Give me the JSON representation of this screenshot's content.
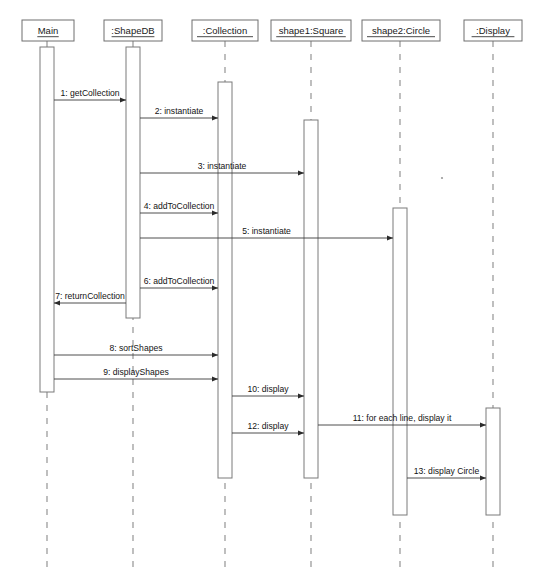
{
  "diagram": {
    "type": "uml-sequence-diagram",
    "canvas": {
      "width": 544,
      "height": 582
    },
    "colors": {
      "background": "#ffffff",
      "box_stroke": "#6e6e6e",
      "lifeline_stroke": "#8a8a8a",
      "activation_stroke": "#7a7a7a",
      "message_stroke": "#3b3b3b",
      "text": "#141414"
    },
    "participants": [
      {
        "id": "main",
        "label": "Main",
        "center_x": 47,
        "box": {
          "x": 22,
          "y": 20,
          "width": 52,
          "height": 21
        },
        "lifeline_top": 41,
        "lifeline_bottom": 570,
        "activations": [
          {
            "top": 47,
            "bottom": 392
          }
        ]
      },
      {
        "id": "shapedb",
        "label": ":ShapeDB",
        "center_x": 133,
        "box": {
          "x": 104,
          "y": 20,
          "width": 58,
          "height": 21
        },
        "lifeline_top": 41,
        "lifeline_bottom": 570,
        "activations": [
          {
            "top": 47,
            "bottom": 318
          }
        ]
      },
      {
        "id": "collection",
        "label": ":Collection",
        "center_x": 225,
        "box": {
          "x": 192,
          "y": 20,
          "width": 66,
          "height": 21
        },
        "lifeline_top": 41,
        "lifeline_bottom": 570,
        "activations": [
          {
            "top": 82,
            "bottom": 478
          }
        ]
      },
      {
        "id": "square",
        "label": "shape1:Square",
        "center_x": 311,
        "box": {
          "x": 271,
          "y": 20,
          "width": 80,
          "height": 21
        },
        "lifeline_top": 41,
        "lifeline_bottom": 570,
        "activations": [
          {
            "top": 120,
            "bottom": 478
          }
        ]
      },
      {
        "id": "circle",
        "label": "shape2:Circle",
        "center_x": 400,
        "box": {
          "x": 362,
          "y": 20,
          "width": 78,
          "height": 21
        },
        "lifeline_top": 41,
        "lifeline_bottom": 570,
        "activations": [
          {
            "top": 208,
            "bottom": 515
          }
        ]
      },
      {
        "id": "display",
        "label": ":Display",
        "center_x": 493,
        "box": {
          "x": 464,
          "y": 20,
          "width": 58,
          "height": 21
        },
        "lifeline_top": 41,
        "lifeline_bottom": 570,
        "activations": [
          {
            "top": 408,
            "bottom": 515
          }
        ]
      }
    ],
    "messages": [
      {
        "seq": 1,
        "label": "1: getCollection",
        "from": "main",
        "to": "shapedb",
        "y": 100,
        "direction": "right",
        "style": "solid"
      },
      {
        "seq": 2,
        "label": "2: instantiate",
        "from": "shapedb",
        "to": "collection",
        "y": 118,
        "direction": "right",
        "style": "solid"
      },
      {
        "seq": 3,
        "label": "3: instantiate",
        "from": "shapedb",
        "to": "square",
        "y": 173,
        "direction": "right",
        "style": "solid"
      },
      {
        "seq": 4,
        "label": "4: addToCollection",
        "from": "shapedb",
        "to": "collection",
        "y": 213,
        "direction": "right",
        "style": "solid"
      },
      {
        "seq": 5,
        "label": "5: instantiate",
        "from": "shapedb",
        "to": "circle",
        "y": 238,
        "direction": "right",
        "style": "solid"
      },
      {
        "seq": 6,
        "label": "6: addToCollection",
        "from": "shapedb",
        "to": "collection",
        "y": 288,
        "direction": "right",
        "style": "solid"
      },
      {
        "seq": 7,
        "label": "7: returnCollection",
        "from": "shapedb",
        "to": "main",
        "y": 303,
        "direction": "left",
        "style": "solid"
      },
      {
        "seq": 8,
        "label": "8: sortShapes",
        "from": "main",
        "to": "collection",
        "y": 355,
        "direction": "right",
        "style": "solid"
      },
      {
        "seq": 9,
        "label": "9: displayShapes",
        "from": "main",
        "to": "collection",
        "y": 379,
        "direction": "right",
        "style": "solid"
      },
      {
        "seq": 10,
        "label": "10: display",
        "from": "collection",
        "to": "square",
        "y": 396,
        "direction": "right",
        "style": "solid"
      },
      {
        "seq": 11,
        "label": "11: for each line, display it",
        "from": "square",
        "to": "display",
        "y": 425,
        "direction": "right",
        "style": "solid"
      },
      {
        "seq": 12,
        "label": "12: display",
        "from": "collection",
        "to": "square",
        "y": 433,
        "direction": "right",
        "style": "solid"
      },
      {
        "seq": 13,
        "label": "13: display Circle",
        "from": "circle",
        "to": "display",
        "y": 478,
        "direction": "right",
        "style": "solid"
      }
    ]
  }
}
